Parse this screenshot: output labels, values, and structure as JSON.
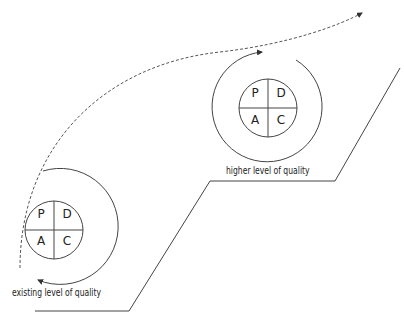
{
  "diagram": {
    "type": "PDCA continuous improvement staircase",
    "cycles": [
      {
        "name": "existing-cycle",
        "quadrants": [
          "P",
          "D",
          "A",
          "C"
        ],
        "label": "existing level of quality"
      },
      {
        "name": "higher-cycle",
        "quadrants": [
          "P",
          "D",
          "A",
          "C"
        ],
        "label": "higher level of quality"
      }
    ],
    "colors": {
      "line": "#444444",
      "text": "#222222"
    }
  }
}
